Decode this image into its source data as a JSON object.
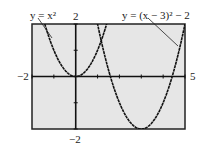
{
  "chart_data": {
    "type": "line",
    "title": "",
    "xlabel": "",
    "ylabel": "",
    "xlim": [
      -2,
      5
    ],
    "ylim": [
      -2,
      2
    ],
    "xticks_step": 1,
    "yticks_step": 1,
    "grid": false,
    "background": "#e6e6e6",
    "series": [
      {
        "name": "y = x^2",
        "label_text": "y = x²",
        "expr": "x^2",
        "color": "#111111"
      },
      {
        "name": "y = (x - 3)^2 - 2",
        "label_text": "y = (x − 3)² − 2",
        "expr": "(x-3)^2-2",
        "color": "#111111"
      }
    ],
    "axis_labels": {
      "xmin": "−2",
      "xmax": "5",
      "ymax": "2",
      "ymin": "−2"
    }
  }
}
